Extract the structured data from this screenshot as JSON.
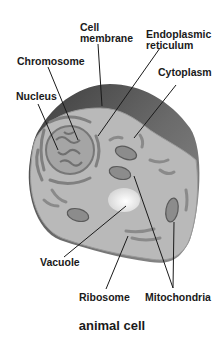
{
  "diagram": {
    "title": "animal cell",
    "labels": {
      "cell_membrane_1": "Cell",
      "cell_membrane_2": "membrane",
      "er_1": "Endoplasmic",
      "er_2": "reticulum",
      "chromosome": "Chromosome",
      "cytoplasm": "Cytoplasm",
      "nucleus": "Nucleus",
      "vacuole": "Vacuole",
      "ribosome": "Ribosome",
      "mitochondria": "Mitochondria"
    },
    "colors": {
      "background": "#ffffff",
      "cytoplasm": "#b8b8b8",
      "membrane_top": "#5a5a5a",
      "organelle": "#8a8a8a",
      "nucleus": "#9a9a9a",
      "vacuole": "#f2f2f2",
      "leader_line": "#1a1a1a"
    }
  }
}
